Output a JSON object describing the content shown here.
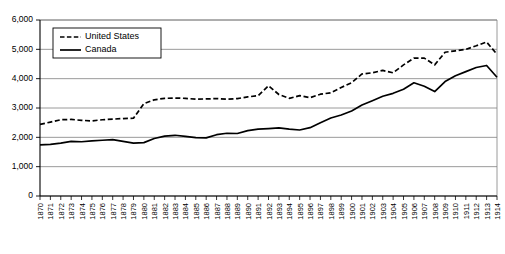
{
  "chart_data": {
    "type": "line",
    "title": "",
    "xlabel": "",
    "ylabel": "",
    "ylim": [
      0,
      6000
    ],
    "ytick_labels": [
      "0",
      "1,000",
      "2,000",
      "3,000",
      "4,000",
      "5,000",
      "6,000"
    ],
    "yticks": [
      0,
      1000,
      2000,
      3000,
      4000,
      5000,
      6000
    ],
    "grid": true,
    "legend_position": "top-left",
    "x": [
      1870,
      1871,
      1872,
      1873,
      1874,
      1875,
      1876,
      1877,
      1878,
      1879,
      1880,
      1881,
      1882,
      1883,
      1884,
      1885,
      1886,
      1887,
      1888,
      1889,
      1890,
      1891,
      1892,
      1893,
      1894,
      1895,
      1896,
      1897,
      1898,
      1899,
      1900,
      1901,
      1902,
      1903,
      1904,
      1905,
      1906,
      1907,
      1908,
      1909,
      1910,
      1911,
      1912,
      1913,
      1914
    ],
    "xtick_labels": [
      "1870",
      "1871",
      "1872",
      "1873",
      "1874",
      "1875",
      "1876",
      "1877",
      "1878",
      "1879",
      "1880",
      "1881",
      "1882",
      "1883",
      "1884",
      "1885",
      "1886",
      "1887",
      "1888",
      "1889",
      "1890",
      "1891",
      "1892",
      "1893",
      "1894",
      "1895",
      "1896",
      "1897",
      "1898",
      "1899",
      "1900",
      "1901",
      "1902",
      "1903",
      "1904",
      "1905",
      "1906",
      "1907",
      "1908",
      "1909",
      "1910",
      "1911",
      "1912",
      "1913",
      "1914"
    ],
    "series": [
      {
        "name": "United States",
        "style": "dashed",
        "color": "#000000",
        "values": [
          2440,
          2520,
          2600,
          2610,
          2580,
          2560,
          2600,
          2620,
          2640,
          2650,
          3150,
          3280,
          3330,
          3340,
          3330,
          3300,
          3310,
          3320,
          3300,
          3320,
          3380,
          3420,
          3760,
          3460,
          3330,
          3420,
          3350,
          3470,
          3520,
          3700,
          3860,
          4160,
          4200,
          4280,
          4200,
          4470,
          4700,
          4700,
          4470,
          4900,
          4950,
          5000,
          5120,
          5250,
          4830
        ]
      },
      {
        "name": "Canada",
        "style": "solid",
        "color": "#000000",
        "values": [
          1740,
          1760,
          1800,
          1860,
          1850,
          1880,
          1900,
          1920,
          1860,
          1800,
          1820,
          1960,
          2040,
          2070,
          2030,
          1990,
          1980,
          2090,
          2140,
          2130,
          2230,
          2280,
          2300,
          2320,
          2280,
          2250,
          2330,
          2500,
          2660,
          2760,
          2900,
          3100,
          3250,
          3400,
          3500,
          3640,
          3860,
          3740,
          3560,
          3900,
          4100,
          4240,
          4380,
          4450,
          4050
        ]
      }
    ]
  },
  "legend": {
    "items": [
      {
        "label": "United States",
        "style": "dashed"
      },
      {
        "label": "Canada",
        "style": "solid"
      }
    ]
  }
}
